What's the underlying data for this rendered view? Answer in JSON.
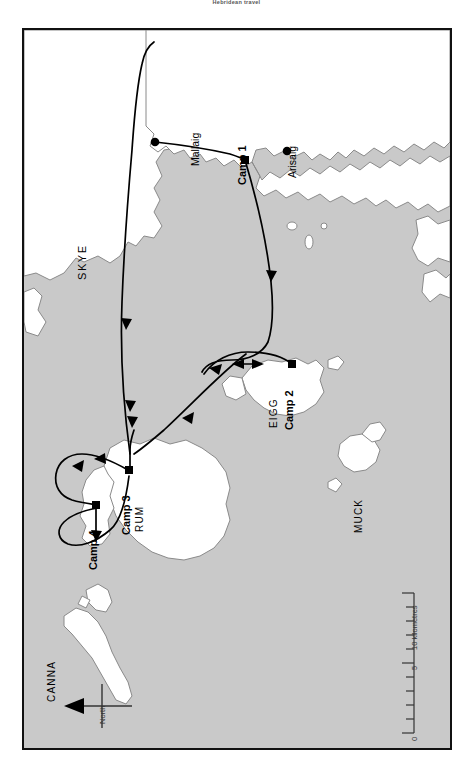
{
  "caption": {
    "text": "Hebridean travel"
  },
  "map": {
    "title": "Small Isles sea-kayak expedition route map",
    "colors": {
      "sea": "#c9c9c9",
      "land": "#ffffff",
      "coastline": "#8a8a8a",
      "route": "#000000",
      "border": "#111111"
    },
    "orientation_note": "map rotated 90 degrees; north points to the left"
  },
  "places": [
    {
      "id": "mallaig",
      "label": "Mallaig",
      "kind": "town",
      "marker": "circle"
    },
    {
      "id": "arisaig",
      "label": "Arisaig",
      "kind": "town",
      "marker": "circle"
    },
    {
      "id": "camp1",
      "label": "Camp 1",
      "kind": "campsite",
      "marker": "square"
    },
    {
      "id": "camp2",
      "label": "Camp 2",
      "kind": "campsite",
      "marker": "square"
    },
    {
      "id": "camp3",
      "label": "Camp 3",
      "kind": "campsite",
      "marker": "square"
    },
    {
      "id": "camp4",
      "label": "Camp 4",
      "kind": "campsite",
      "marker": "square"
    }
  ],
  "islands": [
    {
      "id": "skye",
      "label": "SKYE"
    },
    {
      "id": "rum",
      "label": "RUM"
    },
    {
      "id": "eigg",
      "label": "EIGG"
    },
    {
      "id": "muck",
      "label": "MUCK"
    },
    {
      "id": "canna",
      "label": "CANNA"
    }
  ],
  "scalebar": {
    "unit_label": "10 kilometres",
    "ticks": [
      "0",
      "5"
    ],
    "max": "10",
    "minor_tick_count": 10
  },
  "compass": {
    "label": "North",
    "direction": "left"
  }
}
